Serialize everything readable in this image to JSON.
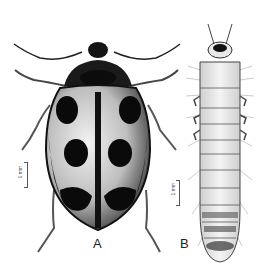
{
  "figure": {
    "panels": [
      {
        "id": "A",
        "label": "A",
        "subject": "adult beetle, dorsal view",
        "scale_bar": "1 mm"
      },
      {
        "id": "B",
        "label": "B",
        "subject": "larva, dorsal view",
        "scale_bar": "1 mm"
      }
    ],
    "colors": {
      "background": "#ffffff",
      "ink": "#111111",
      "elytra_light": "#d9d9d9"
    }
  }
}
